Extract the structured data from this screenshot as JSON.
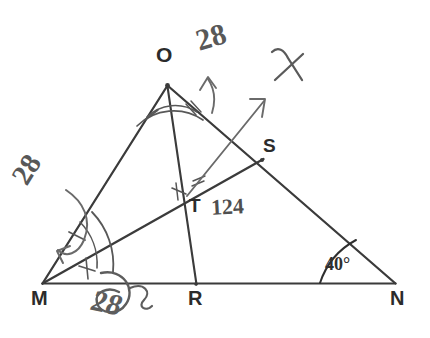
{
  "figure": {
    "kind": "hand-drawn-geometry-diagram",
    "background_color": "#ffffff",
    "ink_color": "#3a3a3a",
    "annotation_color": "#585858",
    "width": 430,
    "height": 338
  },
  "vertices": [
    {
      "id": "O",
      "label": "O",
      "x": 167,
      "y": 85
    },
    {
      "id": "M",
      "label": "M",
      "x": 42,
      "y": 283
    },
    {
      "id": "N",
      "label": "N",
      "x": 395,
      "y": 283
    },
    {
      "id": "S",
      "label": "S",
      "x": 262,
      "y": 160
    },
    {
      "id": "T",
      "label": "T",
      "x": 182,
      "y": 203
    },
    {
      "id": "R",
      "label": "R",
      "x": 196,
      "y": 284
    }
  ],
  "segments": [
    {
      "name": "side-OM",
      "from": "O",
      "to": "M"
    },
    {
      "name": "side-ON",
      "from": "O",
      "to": "N"
    },
    {
      "name": "side-MN",
      "from": "M",
      "to": "N"
    },
    {
      "name": "cevian-OR",
      "from": "O",
      "to": "R"
    },
    {
      "name": "cevian-MS",
      "from": "M",
      "to": "S"
    }
  ],
  "annotations": {
    "angle_o_value": "28",
    "angle_m_value": "28",
    "angle_t_value": "124",
    "angle_n_value": "40°",
    "crossed_out_value": "28",
    "x_mark": "✗"
  },
  "marks": {
    "angle_arc_o": "double-arc-with-tick",
    "angle_arc_m": "double-arc-with-tick",
    "angle_arc_n": "single-arc",
    "tick_o_bisector": "single-tick",
    "tick_m_bisector": "single-tick",
    "tick_t": "double-tick"
  }
}
